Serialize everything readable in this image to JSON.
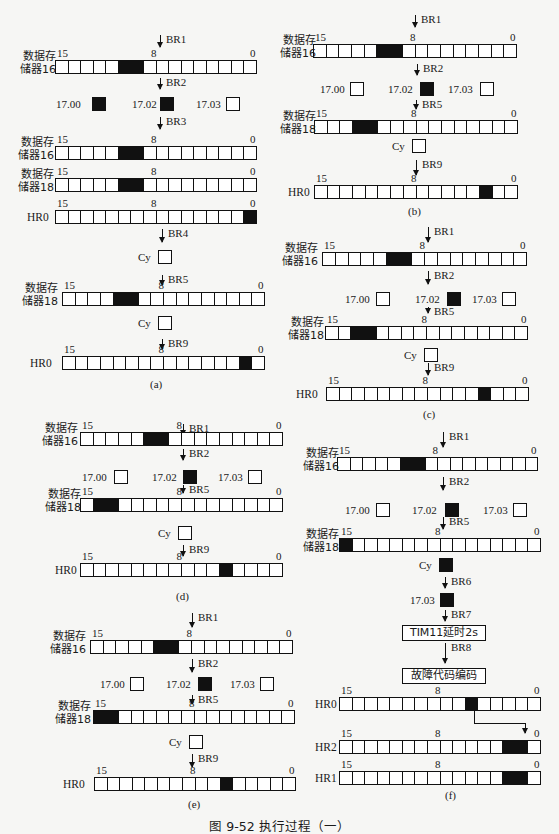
{
  "caption": "图 9-52   执行过程（一）",
  "labels": {
    "dm16": "数据存\n储器16",
    "dm18": "数据存\n储器18",
    "hr0": "HR0",
    "hr1": "HR1",
    "hr2": "HR2",
    "cy": "Cy",
    "bit15": "15",
    "bit8": "8",
    "bit0": "0",
    "in1700": "17.00",
    "in1702": "17.02",
    "in1703": "17.03",
    "tim11": "TIM11延时2s",
    "fault_encode": "故障代码编码"
  },
  "panels": {
    "a": {
      "label": "(a)",
      "steps": [
        "BR1",
        "BR2",
        "BR3",
        "BR4",
        "BR5",
        "BR9"
      ],
      "dm16_first_on_bits": [
        10,
        9
      ],
      "inputs": {
        "17.00": 1,
        "17.02": 1,
        "17.03": 0
      },
      "dm16_second_on_bits": [
        10,
        9
      ],
      "dm18_copy_on_bits": [
        10,
        9
      ],
      "hr0_first_on_bits": [
        0
      ],
      "cy_after_br4": 0,
      "dm18_after_br5_on_bits": [
        11,
        10
      ],
      "cy_after_br5": 0,
      "hr0_after_br9_on_bits": [
        1
      ]
    },
    "b": {
      "label": "(b)",
      "steps": [
        "BR1",
        "BR2",
        "BR5",
        "BR9"
      ],
      "dm16_on_bits": [
        10,
        9
      ],
      "inputs": {
        "17.00": 0,
        "17.02": 1,
        "17.03": 0
      },
      "dm18_on_bits": [
        12,
        11
      ],
      "cy": 0,
      "hr0_on_bits": [
        2
      ]
    },
    "c": {
      "label": "(c)",
      "steps": [
        "BR1",
        "BR2",
        "BR5",
        "BR9"
      ],
      "dm16_on_bits": [
        10,
        9
      ],
      "inputs": {
        "17.00": 0,
        "17.02": 1,
        "17.03": 0
      },
      "dm18_on_bits": [
        13,
        12
      ],
      "cy": 0,
      "hr0_on_bits": [
        3
      ]
    },
    "d": {
      "label": "(d)",
      "steps": [
        "BR1",
        "BR2",
        "BR5",
        "BR9"
      ],
      "dm16_on_bits": [
        10,
        9
      ],
      "inputs": {
        "17.00": 0,
        "17.02": 1,
        "17.03": 0
      },
      "dm18_on_bits": [
        14,
        13
      ],
      "cy": 0,
      "hr0_on_bits": [
        4
      ]
    },
    "e": {
      "label": "(e)",
      "steps": [
        "BR1",
        "BR2",
        "BR5",
        "BR9"
      ],
      "dm16_on_bits": [
        10,
        9
      ],
      "inputs": {
        "17.00": 0,
        "17.02": 1,
        "17.03": 0
      },
      "dm18_on_bits": [
        15,
        14
      ],
      "cy": 0,
      "hr0_on_bits": [
        5
      ]
    },
    "f": {
      "label": "(f)",
      "steps": [
        "BR1",
        "BR2",
        "BR5",
        "BR6",
        "BR7",
        "BR8"
      ],
      "dm16_on_bits": [
        10,
        9
      ],
      "inputs": {
        "17.00": 0,
        "17.02": 1,
        "17.03": 0
      },
      "dm18_on_bits": [
        15
      ],
      "cy": 1,
      "in1703_after_br6": 1,
      "process_boxes": [
        "TIM11延时2s",
        "故障代码编码"
      ],
      "hr0_on_bits": [
        5
      ],
      "hr2_on_bits": [
        2,
        1
      ],
      "hr1_on_bits": [
        2,
        1
      ]
    }
  },
  "colors": {
    "background": "#f6f6f4",
    "ink": "#111111",
    "cell_on": "#111111",
    "cell_off": "#ffffff"
  }
}
